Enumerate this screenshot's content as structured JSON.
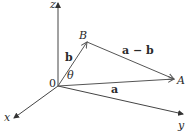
{
  "diagram": {
    "type": "3d-vector-diagram",
    "axes": {
      "x_label": "x",
      "y_label": "y",
      "z_label": "z",
      "origin_label": "0"
    },
    "points": {
      "A": "A",
      "B": "B"
    },
    "vectors": {
      "a": "a",
      "b": "b",
      "a_minus_b": "a − b"
    },
    "angle_label": "θ",
    "colors": {
      "axis": "#444444",
      "vector": "#555555",
      "text": "#2a2a2a",
      "background": "#ffffff"
    }
  }
}
